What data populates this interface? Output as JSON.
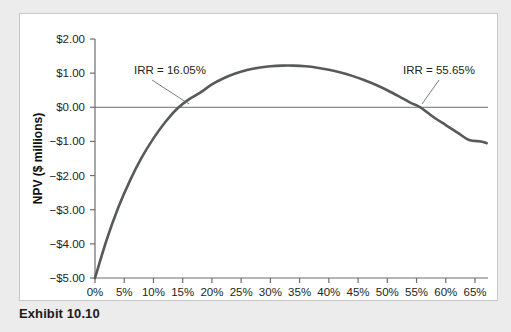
{
  "caption": "Exhibit 10.10",
  "chart_data": {
    "type": "line",
    "title": "",
    "xlabel": "Discount Rate",
    "ylabel": "NPV ($ millions)",
    "xlim": [
      0,
      65
    ],
    "ylim": [
      -5.0,
      2.0
    ],
    "xticklabels": [
      "0%",
      "5%",
      "10%",
      "15%",
      "20%",
      "25%",
      "30%",
      "35%",
      "40%",
      "45%",
      "50%",
      "55%",
      "60%",
      "65%"
    ],
    "xtickvalues": [
      0,
      5,
      10,
      15,
      20,
      25,
      30,
      35,
      40,
      45,
      50,
      55,
      60,
      65
    ],
    "yticklabels": [
      "$2.00",
      "$1.00",
      "$0.00",
      "-$1.00",
      "-$2.00",
      "-$3.00",
      "-$4.00",
      "-$5.00"
    ],
    "ytickvalues": [
      2,
      1,
      0,
      -1,
      -2,
      -3,
      -4,
      -5
    ],
    "grid": false,
    "legend": "none",
    "zero_line": 0,
    "series": [
      {
        "name": "NPV profile",
        "color": "#58595b",
        "x": [
          0,
          2,
          4,
          6,
          8,
          10,
          12,
          14,
          16.05,
          18,
          20,
          22,
          24,
          26,
          28,
          30,
          32,
          34,
          36,
          38,
          40,
          42,
          44,
          46,
          48,
          50,
          52,
          54,
          55.65,
          58,
          60,
          62,
          64,
          66,
          67
        ],
        "values": [
          -5.0,
          -3.88,
          -2.93,
          -2.14,
          -1.47,
          -0.91,
          -0.44,
          -0.05,
          0.23,
          0.43,
          0.67,
          0.85,
          0.99,
          1.09,
          1.16,
          1.2,
          1.22,
          1.22,
          1.2,
          1.16,
          1.1,
          1.02,
          0.92,
          0.8,
          0.66,
          0.5,
          0.32,
          0.13,
          0.0,
          -0.3,
          -0.52,
          -0.74,
          -0.96,
          -1.0,
          -1.05
        ]
      }
    ],
    "annotations": [
      {
        "label": "IRR = 16.05%",
        "value": 16.05,
        "text_x": 133,
        "text_y": 73,
        "leader_from_x": 151,
        "leader_from_y": 79,
        "leader_to_x": 188,
        "leader_to_y": 103
      },
      {
        "label": "IRR = 55.65%",
        "value": 55.65,
        "text_x": 402,
        "text_y": 73,
        "leader_from_x": 438,
        "leader_from_y": 79,
        "leader_to_x": 421,
        "leader_to_y": 103
      }
    ]
  }
}
